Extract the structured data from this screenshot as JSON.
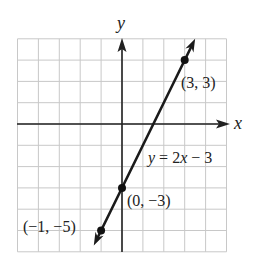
{
  "chart_data": {
    "type": "line",
    "title": "",
    "xlabel": "x",
    "ylabel": "y",
    "xlim": [
      -5,
      5
    ],
    "ylim": [
      -6,
      4
    ],
    "grid": true,
    "grid_step": 1,
    "series": [
      {
        "name": "y = 2x − 3",
        "equation": "y = 2x − 3",
        "slope": 2,
        "intercept": -3,
        "x": [
          -1.35,
          3.5
        ],
        "y": [
          -5.7,
          4.0
        ]
      }
    ],
    "points": [
      {
        "x": 3,
        "y": 3,
        "label": "(3, 3)"
      },
      {
        "x": 0,
        "y": -3,
        "label": "(0, −3)"
      },
      {
        "x": -1,
        "y": -5,
        "label": "(−1, −5)"
      }
    ],
    "annotations": [
      {
        "text": "y = 2x − 3",
        "near": [
          2.6,
          -1.6
        ]
      }
    ]
  },
  "labels": {
    "x_axis": "x",
    "y_axis": "y",
    "equation_y": "y",
    "equation_rest": " = 2",
    "equation_x": "x",
    "equation_tail": " − 3",
    "p1": "(3, 3)",
    "p2": "(0, −3)",
    "p3": "(−1, −5)"
  },
  "colors": {
    "grid": "#c8c8c8",
    "axis": "#222222",
    "line": "#1a1a1a",
    "point": "#111111"
  }
}
